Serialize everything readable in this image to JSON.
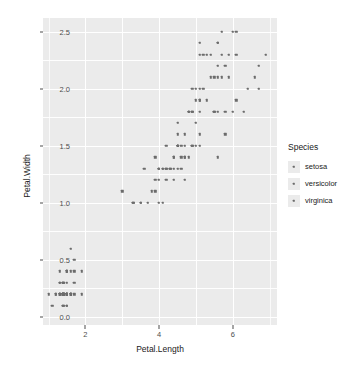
{
  "chart_data": {
    "type": "scatter",
    "title": "",
    "xlabel": "Petal.Length",
    "ylabel": "Petal.Width",
    "xlim": [
      0.85,
      7.2
    ],
    "ylim": [
      -0.07,
      2.62
    ],
    "xticks": [
      "2",
      "4",
      "6"
    ],
    "xtick_values": [
      2,
      4,
      6
    ],
    "yticks": [
      "0.0",
      "0.5",
      "1.0",
      "1.5",
      "2.0",
      "2.5"
    ],
    "ytick_values": [
      0.0,
      0.5,
      1.0,
      1.5,
      2.0,
      2.5
    ],
    "grid": true,
    "legend_position": "right",
    "legend_title": "Species",
    "point_color": "#6b6b6b",
    "panel_color": "#ebebeb",
    "grid_color": "#ffffff",
    "series": [
      {
        "name": "setosa",
        "color": "#6b6b6b",
        "points": [
          [
            1.4,
            0.2
          ],
          [
            1.4,
            0.2
          ],
          [
            1.3,
            0.2
          ],
          [
            1.5,
            0.2
          ],
          [
            1.4,
            0.2
          ],
          [
            1.7,
            0.4
          ],
          [
            1.4,
            0.3
          ],
          [
            1.5,
            0.2
          ],
          [
            1.4,
            0.2
          ],
          [
            1.5,
            0.1
          ],
          [
            1.5,
            0.2
          ],
          [
            1.6,
            0.2
          ],
          [
            1.4,
            0.1
          ],
          [
            1.1,
            0.1
          ],
          [
            1.2,
            0.2
          ],
          [
            1.5,
            0.4
          ],
          [
            1.3,
            0.4
          ],
          [
            1.4,
            0.3
          ],
          [
            1.7,
            0.3
          ],
          [
            1.5,
            0.3
          ],
          [
            1.7,
            0.2
          ],
          [
            1.5,
            0.4
          ],
          [
            1.0,
            0.2
          ],
          [
            1.7,
            0.5
          ],
          [
            1.9,
            0.2
          ],
          [
            1.6,
            0.2
          ],
          [
            1.6,
            0.4
          ],
          [
            1.5,
            0.2
          ],
          [
            1.4,
            0.2
          ],
          [
            1.6,
            0.2
          ],
          [
            1.6,
            0.2
          ],
          [
            1.5,
            0.4
          ],
          [
            1.5,
            0.1
          ],
          [
            1.4,
            0.2
          ],
          [
            1.5,
            0.2
          ],
          [
            1.2,
            0.2
          ],
          [
            1.3,
            0.2
          ],
          [
            1.4,
            0.1
          ],
          [
            1.3,
            0.2
          ],
          [
            1.5,
            0.2
          ],
          [
            1.3,
            0.3
          ],
          [
            1.3,
            0.3
          ],
          [
            1.3,
            0.2
          ],
          [
            1.6,
            0.6
          ],
          [
            1.9,
            0.4
          ],
          [
            1.4,
            0.3
          ],
          [
            1.6,
            0.2
          ],
          [
            1.4,
            0.2
          ],
          [
            1.5,
            0.2
          ],
          [
            1.4,
            0.2
          ]
        ]
      },
      {
        "name": "versicolor",
        "color": "#6b6b6b",
        "points": [
          [
            4.7,
            1.4
          ],
          [
            4.5,
            1.5
          ],
          [
            4.9,
            1.5
          ],
          [
            4.0,
            1.3
          ],
          [
            4.6,
            1.5
          ],
          [
            4.5,
            1.3
          ],
          [
            4.7,
            1.6
          ],
          [
            3.3,
            1.0
          ],
          [
            4.6,
            1.3
          ],
          [
            3.9,
            1.4
          ],
          [
            3.5,
            1.0
          ],
          [
            4.2,
            1.5
          ],
          [
            4.0,
            1.0
          ],
          [
            4.7,
            1.4
          ],
          [
            3.6,
            1.3
          ],
          [
            4.4,
            1.4
          ],
          [
            4.5,
            1.5
          ],
          [
            4.1,
            1.0
          ],
          [
            4.5,
            1.5
          ],
          [
            3.9,
            1.1
          ],
          [
            4.8,
            1.8
          ],
          [
            4.0,
            1.3
          ],
          [
            4.9,
            1.5
          ],
          [
            4.7,
            1.2
          ],
          [
            4.3,
            1.3
          ],
          [
            4.4,
            1.4
          ],
          [
            4.8,
            1.4
          ],
          [
            5.0,
            1.7
          ],
          [
            4.5,
            1.5
          ],
          [
            3.5,
            1.0
          ],
          [
            3.8,
            1.1
          ],
          [
            3.7,
            1.0
          ],
          [
            3.9,
            1.2
          ],
          [
            5.1,
            1.6
          ],
          [
            4.5,
            1.5
          ],
          [
            4.5,
            1.6
          ],
          [
            4.7,
            1.5
          ],
          [
            4.4,
            1.3
          ],
          [
            4.1,
            1.3
          ],
          [
            4.0,
            1.3
          ],
          [
            4.4,
            1.2
          ],
          [
            4.6,
            1.4
          ],
          [
            4.0,
            1.2
          ],
          [
            3.3,
            1.0
          ],
          [
            4.2,
            1.3
          ],
          [
            4.2,
            1.2
          ],
          [
            4.2,
            1.3
          ],
          [
            4.3,
            1.3
          ],
          [
            3.0,
            1.1
          ],
          [
            4.1,
            1.3
          ]
        ]
      },
      {
        "name": "virginica",
        "color": "#6b6b6b",
        "points": [
          [
            6.0,
            2.5
          ],
          [
            5.1,
            1.9
          ],
          [
            5.9,
            2.1
          ],
          [
            5.6,
            1.8
          ],
          [
            5.8,
            2.2
          ],
          [
            6.6,
            2.1
          ],
          [
            4.5,
            1.7
          ],
          [
            6.3,
            1.8
          ],
          [
            5.8,
            1.8
          ],
          [
            6.1,
            2.5
          ],
          [
            5.1,
            2.0
          ],
          [
            5.3,
            1.9
          ],
          [
            5.5,
            2.1
          ],
          [
            5.0,
            2.0
          ],
          [
            5.1,
            2.4
          ],
          [
            5.3,
            2.3
          ],
          [
            5.5,
            1.8
          ],
          [
            6.7,
            2.2
          ],
          [
            6.9,
            2.3
          ],
          [
            5.0,
            1.5
          ],
          [
            5.7,
            2.3
          ],
          [
            4.9,
            2.0
          ],
          [
            6.7,
            2.0
          ],
          [
            4.9,
            1.8
          ],
          [
            5.7,
            2.1
          ],
          [
            6.0,
            1.8
          ],
          [
            4.8,
            1.8
          ],
          [
            4.9,
            1.8
          ],
          [
            5.6,
            2.1
          ],
          [
            5.8,
            1.6
          ],
          [
            6.1,
            1.9
          ],
          [
            6.4,
            2.0
          ],
          [
            5.6,
            2.2
          ],
          [
            5.1,
            1.5
          ],
          [
            5.6,
            1.4
          ],
          [
            6.1,
            2.3
          ],
          [
            5.6,
            2.4
          ],
          [
            5.5,
            1.8
          ],
          [
            4.8,
            1.8
          ],
          [
            5.4,
            2.1
          ],
          [
            5.6,
            2.4
          ],
          [
            5.1,
            2.3
          ],
          [
            5.1,
            1.9
          ],
          [
            5.9,
            2.3
          ],
          [
            5.7,
            2.5
          ],
          [
            5.2,
            2.3
          ],
          [
            5.0,
            1.9
          ],
          [
            5.2,
            2.0
          ],
          [
            5.4,
            2.3
          ],
          [
            5.1,
            1.8
          ]
        ]
      }
    ]
  },
  "legend": {
    "title": "Species",
    "items": [
      {
        "label": "setosa"
      },
      {
        "label": "versicolor"
      },
      {
        "label": "virginica"
      }
    ]
  },
  "axes": {
    "x_title": "Petal.Length",
    "y_title": "Petal.Width"
  }
}
